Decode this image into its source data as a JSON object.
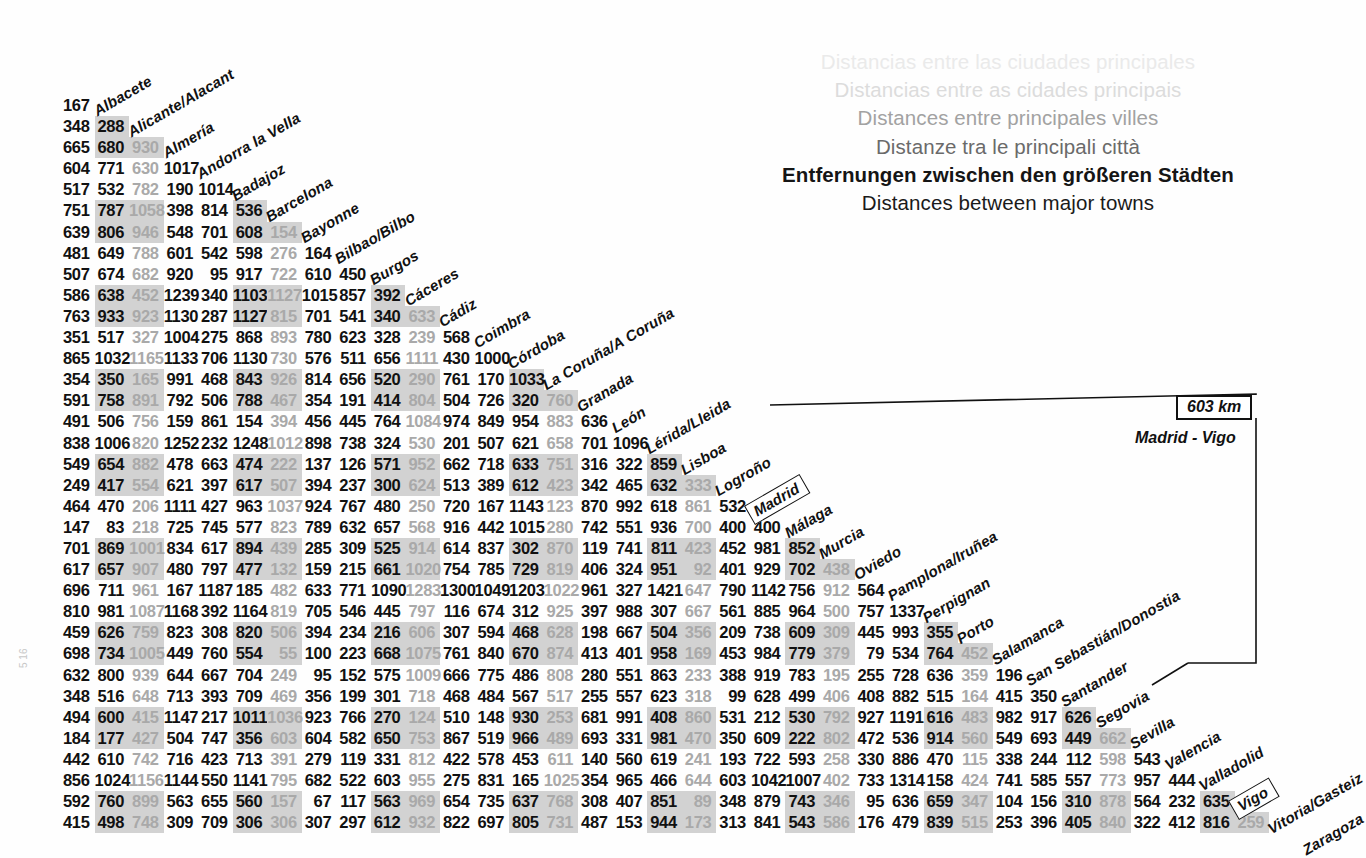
{
  "titles": {
    "lines": [
      "Distancias entre las ciudades principales",
      "Distancias entre as cidades principais",
      "Distances entre principales villes",
      "Distanze tra le principali città",
      "Entfernungen zwischen den größeren Städten",
      "Distances between major towns"
    ]
  },
  "callout": {
    "distance": "603 km",
    "pair": "Madrid - Vigo",
    "from": "Madrid",
    "to": "Vigo"
  },
  "edge_mark": "5 16",
  "chart_data": {
    "type": "table",
    "title": "Distances between major towns",
    "subtitle": "Spain / Portugal road distance matrix (km)",
    "unit": "km",
    "layout": "lower-triangular half matrix; row i lists distances from city i+1 to cities 1..i",
    "cities": [
      "Albacete",
      "Alicante/Alacant",
      "Almería",
      "Andorra la Vella",
      "Badajoz",
      "Barcelona",
      "Bayonne",
      "Bilbao/Bilbo",
      "Burgos",
      "Cáceres",
      "Cádiz",
      "Coimbra",
      "Córdoba",
      "La Coruña/A Coruña",
      "Granada",
      "León",
      "Lérida/Lleida",
      "Lisboa",
      "Logroño",
      "Madrid",
      "Málaga",
      "Murcia",
      "Oviedo",
      "Pamplona/Iruñea",
      "Perpignan",
      "Porto",
      "Salamanca",
      "San Sebastián/Donostia",
      "Santander",
      "Segovia",
      "Sevilla",
      "Valencia",
      "Valladolid",
      "Vigo",
      "Vitoria/Gasteiz",
      "Zaragoza"
    ],
    "rows": [
      [
        167
      ],
      [
        348,
        288
      ],
      [
        665,
        680,
        930
      ],
      [
        604,
        771,
        630,
        1017
      ],
      [
        517,
        532,
        782,
        190,
        1014
      ],
      [
        751,
        787,
        1058,
        398,
        814,
        536
      ],
      [
        639,
        806,
        946,
        548,
        701,
        608,
        154
      ],
      [
        481,
        649,
        788,
        601,
        542,
        598,
        276,
        164
      ],
      [
        507,
        674,
        682,
        920,
        95,
        917,
        722,
        610,
        450
      ],
      [
        586,
        638,
        452,
        1239,
        340,
        1103,
        1127,
        1015,
        857,
        392
      ],
      [
        763,
        933,
        923,
        1130,
        287,
        1127,
        815,
        701,
        541,
        340,
        633
      ],
      [
        351,
        517,
        327,
        1004,
        275,
        868,
        893,
        780,
        623,
        328,
        239,
        568
      ],
      [
        865,
        1032,
        1165,
        1133,
        706,
        1130,
        730,
        576,
        511,
        656,
        1111,
        430,
        1000
      ],
      [
        354,
        350,
        165,
        991,
        468,
        843,
        926,
        814,
        656,
        520,
        290,
        761,
        170,
        1033
      ],
      [
        591,
        758,
        891,
        792,
        506,
        788,
        467,
        354,
        191,
        414,
        804,
        504,
        726,
        320,
        760
      ],
      [
        491,
        506,
        756,
        159,
        861,
        154,
        394,
        456,
        445,
        764,
        1084,
        974,
        849,
        954,
        883,
        636
      ],
      [
        838,
        1006,
        820,
        1252,
        232,
        1248,
        1012,
        898,
        738,
        324,
        530,
        201,
        507,
        621,
        658,
        701,
        1096
      ],
      [
        549,
        654,
        882,
        478,
        663,
        474,
        222,
        137,
        126,
        571,
        952,
        662,
        718,
        633,
        751,
        316,
        322,
        859
      ],
      [
        249,
        417,
        554,
        621,
        397,
        617,
        507,
        394,
        237,
        300,
        624,
        513,
        389,
        612,
        423,
        342,
        465,
        632,
        333
      ],
      [
        464,
        470,
        206,
        1111,
        427,
        963,
        1037,
        924,
        767,
        480,
        250,
        720,
        167,
        1143,
        123,
        870,
        992,
        618,
        861,
        532
      ],
      [
        147,
        83,
        218,
        725,
        745,
        577,
        823,
        789,
        632,
        657,
        568,
        916,
        442,
        1015,
        280,
        742,
        551,
        936,
        700,
        400,
        400
      ],
      [
        701,
        869,
        1001,
        834,
        617,
        894,
        439,
        285,
        309,
        525,
        914,
        614,
        837,
        302,
        870,
        119,
        741,
        811,
        423,
        452,
        981,
        852
      ],
      [
        617,
        657,
        907,
        480,
        797,
        477,
        132,
        159,
        215,
        661,
        1020,
        754,
        785,
        729,
        819,
        406,
        324,
        951,
        92,
        401,
        929,
        702,
        438
      ],
      [
        696,
        711,
        961,
        167,
        1187,
        185,
        482,
        633,
        771,
        1090,
        1283,
        1300,
        1049,
        1203,
        1022,
        961,
        327,
        1421,
        647,
        790,
        1142,
        756,
        912,
        564
      ],
      [
        810,
        981,
        1087,
        1168,
        392,
        1164,
        819,
        705,
        546,
        445,
        797,
        116,
        674,
        312,
        925,
        397,
        988,
        307,
        667,
        561,
        885,
        964,
        500,
        757,
        1337
      ],
      [
        459,
        626,
        759,
        823,
        308,
        820,
        506,
        394,
        234,
        216,
        606,
        307,
        594,
        468,
        628,
        198,
        667,
        504,
        356,
        209,
        738,
        609,
        309,
        445,
        993,
        355
      ],
      [
        698,
        734,
        1005,
        449,
        760,
        554,
        55,
        100,
        223,
        668,
        1075,
        761,
        840,
        670,
        874,
        413,
        401,
        958,
        169,
        453,
        984,
        779,
        379,
        79,
        534,
        764,
        452
      ],
      [
        632,
        800,
        939,
        644,
        667,
        704,
        249,
        95,
        152,
        575,
        1009,
        666,
        775,
        486,
        808,
        280,
        551,
        863,
        233,
        388,
        919,
        783,
        195,
        255,
        728,
        636,
        359,
        196
      ],
      [
        348,
        516,
        648,
        713,
        393,
        709,
        469,
        356,
        199,
        301,
        718,
        468,
        484,
        567,
        517,
        255,
        557,
        623,
        318,
        99,
        628,
        499,
        406,
        408,
        882,
        515,
        164,
        415,
        350
      ],
      [
        494,
        600,
        415,
        1147,
        217,
        1011,
        1036,
        923,
        766,
        270,
        124,
        510,
        148,
        930,
        253,
        681,
        991,
        408,
        860,
        531,
        212,
        530,
        792,
        927,
        1191,
        616,
        483,
        982,
        917,
        626
      ],
      [
        184,
        177,
        427,
        504,
        747,
        356,
        603,
        604,
        582,
        650,
        753,
        867,
        519,
        966,
        489,
        693,
        331,
        981,
        470,
        350,
        609,
        222,
        802,
        472,
        536,
        914,
        560,
        549,
        693,
        449,
        662
      ],
      [
        442,
        610,
        742,
        716,
        423,
        713,
        391,
        279,
        119,
        331,
        812,
        422,
        578,
        453,
        611,
        140,
        560,
        619,
        241,
        193,
        722,
        593,
        258,
        330,
        886,
        470,
        115,
        338,
        244,
        112,
        598,
        543
      ],
      [
        856,
        1024,
        1156,
        1144,
        550,
        1141,
        795,
        682,
        522,
        603,
        955,
        275,
        831,
        165,
        1025,
        354,
        965,
        466,
        644,
        603,
        1042,
        1007,
        402,
        733,
        1314,
        158,
        424,
        741,
        585,
        557,
        773,
        957,
        444
      ],
      [
        592,
        760,
        899,
        563,
        655,
        560,
        157,
        67,
        117,
        563,
        969,
        654,
        735,
        637,
        768,
        308,
        407,
        851,
        89,
        348,
        879,
        743,
        346,
        95,
        636,
        659,
        347,
        104,
        156,
        310,
        878,
        564,
        232,
        635
      ],
      [
        415,
        498,
        748,
        309,
        709,
        306,
        306,
        307,
        297,
        612,
        932,
        822,
        697,
        805,
        731,
        487,
        153,
        944,
        173,
        313,
        841,
        543,
        586,
        176,
        479,
        839,
        515,
        253,
        396,
        405,
        840,
        322,
        412,
        816,
        259
      ]
    ],
    "boxed_cities": [
      "Madrid",
      "Vigo"
    ],
    "shading": {
      "note": "alternating 2-on / 2-off bands on both rows and columns; light-gray text used on every 4th column",
      "band_color": "#d2d2d2",
      "light_text_color": "#a9a9a9"
    }
  }
}
